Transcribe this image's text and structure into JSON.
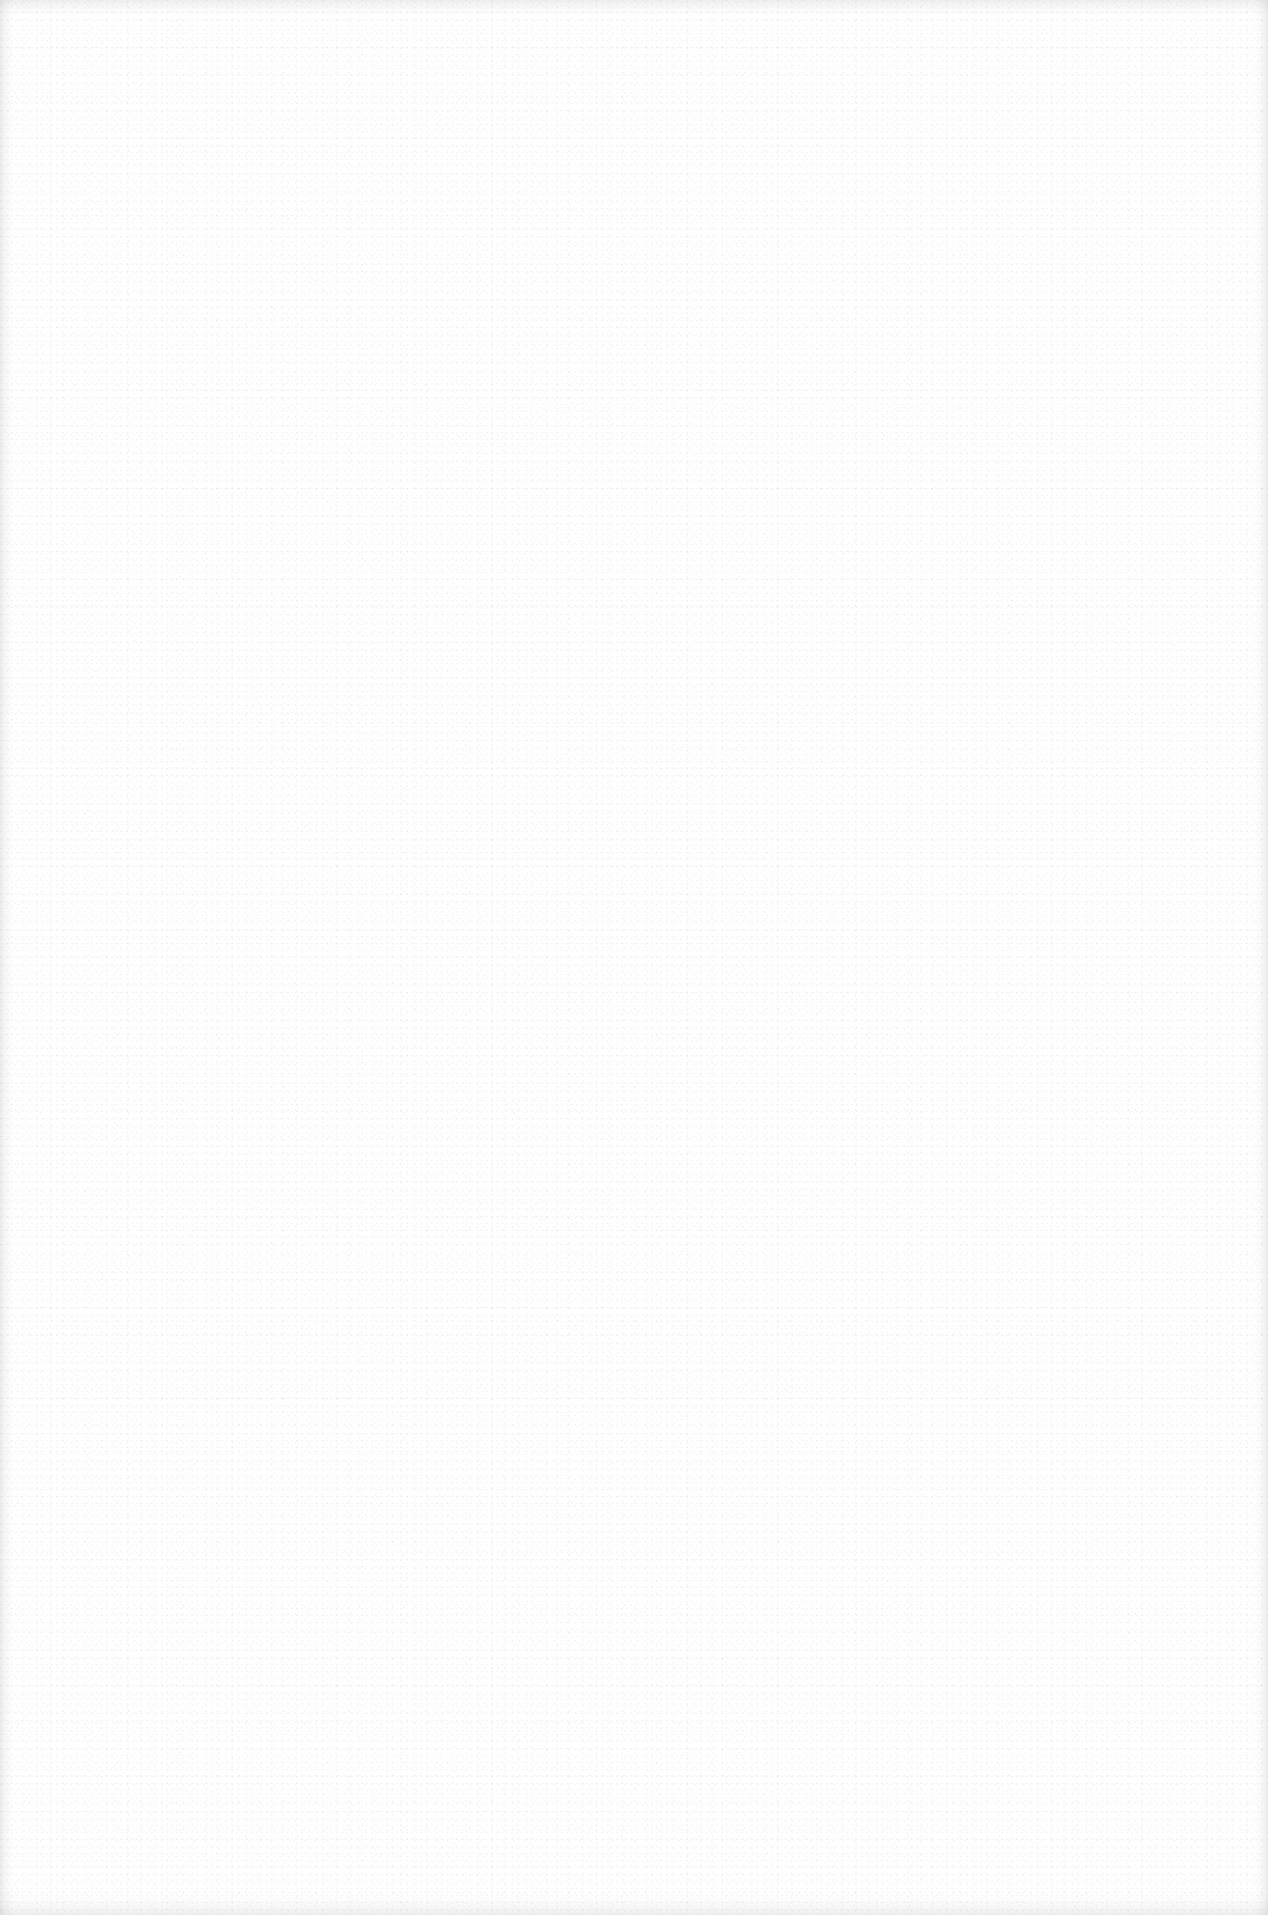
{
  "page": {
    "type": "blank scanned page",
    "background_color": "#fefefe",
    "texture": "light speckle noise",
    "edge_shading_color": "#e6e6e6",
    "text_content": []
  }
}
